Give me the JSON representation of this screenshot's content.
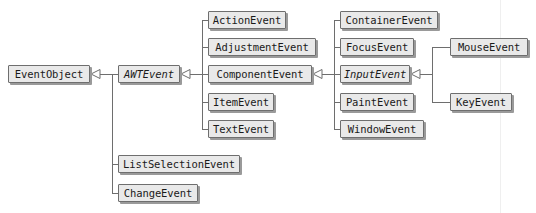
{
  "diagram": {
    "type": "uml-class-hierarchy",
    "canvas": {
      "width": 536,
      "height": 213
    },
    "style": {
      "box_fill": "#e9e9e9",
      "box_border": "#6e6e6e",
      "box_shadow": "#9a9a9a",
      "line_color": "#6e6e6e",
      "text_color": "#1a1a1a",
      "background": "#ffffff",
      "arrowhead": "hollow-triangle-generalization"
    },
    "nodes": [
      {
        "id": "EventObject",
        "label": "EventObject",
        "abstract": false,
        "x": 8,
        "y": 65,
        "w": 82,
        "column": 0
      },
      {
        "id": "AWTEvent",
        "label": "AWTEvent",
        "abstract": true,
        "x": 118,
        "y": 65,
        "w": 62,
        "column": 1
      },
      {
        "id": "ListSelectionEvent",
        "label": "ListSelectionEvent",
        "abstract": false,
        "x": 118,
        "y": 155,
        "w": 122,
        "column": 1
      },
      {
        "id": "ChangeEvent",
        "label": "ChangeEvent",
        "abstract": false,
        "x": 118,
        "y": 184,
        "w": 80,
        "column": 1
      },
      {
        "id": "ActionEvent",
        "label": "ActionEvent",
        "abstract": false,
        "x": 208,
        "y": 11,
        "w": 78,
        "column": 2
      },
      {
        "id": "AdjustmentEvent",
        "label": "AdjustmentEvent",
        "abstract": false,
        "x": 208,
        "y": 38,
        "w": 108,
        "column": 2
      },
      {
        "id": "ComponentEvent",
        "label": "ComponentEvent",
        "abstract": false,
        "x": 208,
        "y": 65,
        "w": 104,
        "column": 2
      },
      {
        "id": "ItemEvent",
        "label": "ItemEvent",
        "abstract": false,
        "x": 208,
        "y": 93,
        "w": 66,
        "column": 2
      },
      {
        "id": "TextEvent",
        "label": "TextEvent",
        "abstract": false,
        "x": 208,
        "y": 120,
        "w": 66,
        "column": 2
      },
      {
        "id": "ContainerEvent",
        "label": "ContainerEvent",
        "abstract": false,
        "x": 340,
        "y": 11,
        "w": 98,
        "column": 3
      },
      {
        "id": "FocusEvent",
        "label": "FocusEvent",
        "abstract": false,
        "x": 340,
        "y": 38,
        "w": 74,
        "column": 3
      },
      {
        "id": "InputEvent",
        "label": "InputEvent",
        "abstract": true,
        "x": 340,
        "y": 65,
        "w": 70,
        "column": 3
      },
      {
        "id": "PaintEvent",
        "label": "PaintEvent",
        "abstract": false,
        "x": 340,
        "y": 93,
        "w": 74,
        "column": 3
      },
      {
        "id": "WindowEvent",
        "label": "WindowEvent",
        "abstract": false,
        "x": 340,
        "y": 120,
        "w": 84,
        "column": 3
      },
      {
        "id": "MouseEvent",
        "label": "MouseEvent",
        "abstract": false,
        "x": 450,
        "y": 38,
        "w": 78,
        "column": 4
      },
      {
        "id": "KeyEvent",
        "label": "KeyEvent",
        "abstract": false,
        "x": 450,
        "y": 93,
        "w": 62,
        "column": 4
      }
    ],
    "edges": [
      {
        "from": "AWTEvent",
        "to": "EventObject",
        "kind": "generalization"
      },
      {
        "from": "ListSelectionEvent",
        "to": "EventObject",
        "kind": "generalization"
      },
      {
        "from": "ChangeEvent",
        "to": "EventObject",
        "kind": "generalization"
      },
      {
        "from": "ActionEvent",
        "to": "AWTEvent",
        "kind": "generalization"
      },
      {
        "from": "AdjustmentEvent",
        "to": "AWTEvent",
        "kind": "generalization"
      },
      {
        "from": "ComponentEvent",
        "to": "AWTEvent",
        "kind": "generalization"
      },
      {
        "from": "ItemEvent",
        "to": "AWTEvent",
        "kind": "generalization"
      },
      {
        "from": "TextEvent",
        "to": "AWTEvent",
        "kind": "generalization"
      },
      {
        "from": "ContainerEvent",
        "to": "ComponentEvent",
        "kind": "generalization"
      },
      {
        "from": "FocusEvent",
        "to": "ComponentEvent",
        "kind": "generalization"
      },
      {
        "from": "InputEvent",
        "to": "ComponentEvent",
        "kind": "generalization"
      },
      {
        "from": "PaintEvent",
        "to": "ComponentEvent",
        "kind": "generalization"
      },
      {
        "from": "WindowEvent",
        "to": "ComponentEvent",
        "kind": "generalization"
      },
      {
        "from": "MouseEvent",
        "to": "InputEvent",
        "kind": "generalization"
      },
      {
        "from": "KeyEvent",
        "to": "InputEvent",
        "kind": "generalization"
      }
    ]
  }
}
